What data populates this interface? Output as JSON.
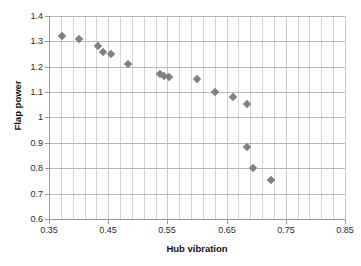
{
  "chart_data": {
    "type": "scatter",
    "title": "",
    "xlabel": "Hub vibration",
    "ylabel": "Flap power",
    "xlim": [
      0.35,
      0.85
    ],
    "ylim": [
      0.6,
      1.4
    ],
    "xticks": [
      "0.35",
      "0.45",
      "0.55",
      "0.65",
      "0.75",
      "0.85"
    ],
    "xtick_values": [
      0.35,
      0.45,
      0.55,
      0.65,
      0.75,
      0.85
    ],
    "yticks": [
      "0.6",
      "0.7",
      "0.8",
      "0.9",
      "1",
      "1.1",
      "1.2",
      "1.3",
      "1.4"
    ],
    "ytick_values": [
      0.6,
      0.7,
      0.8,
      0.9,
      1.0,
      1.1,
      1.2,
      1.3,
      1.4
    ],
    "x_minor_step": 0.02,
    "y_major_step": 0.1,
    "grid": true,
    "grid_vertical": true,
    "grid_horizontal": true,
    "legend": false,
    "legend_position": "none",
    "marker": "diamond",
    "marker_color": "#808080",
    "marker_size": 6,
    "points": [
      {
        "x": 0.372,
        "y": 1.32
      },
      {
        "x": 0.4,
        "y": 1.31
      },
      {
        "x": 0.432,
        "y": 1.28
      },
      {
        "x": 0.442,
        "y": 1.26
      },
      {
        "x": 0.455,
        "y": 1.25
      },
      {
        "x": 0.483,
        "y": 1.21
      },
      {
        "x": 0.538,
        "y": 1.17
      },
      {
        "x": 0.545,
        "y": 1.165
      },
      {
        "x": 0.552,
        "y": 1.16
      },
      {
        "x": 0.6,
        "y": 1.15
      },
      {
        "x": 0.63,
        "y": 1.1
      },
      {
        "x": 0.66,
        "y": 1.082
      },
      {
        "x": 0.685,
        "y": 1.052
      },
      {
        "x": 0.685,
        "y": 0.882
      },
      {
        "x": 0.695,
        "y": 0.802
      },
      {
        "x": 0.725,
        "y": 0.752
      }
    ]
  },
  "colors": {
    "marker": "#808080",
    "grid_minor": "#d4d4d4",
    "grid_major": "#b9b9b9",
    "axis": "#9a9a9a",
    "text": "#2b2b2b",
    "title_text": "#111111",
    "background": "#ffffff"
  }
}
